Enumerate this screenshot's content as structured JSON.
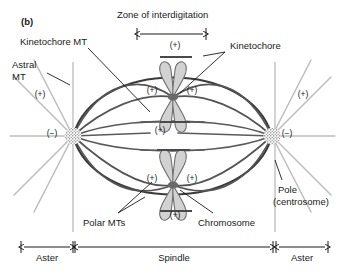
{
  "figure": {
    "panel_label": "(b)"
  },
  "labels": {
    "zone": "Zone of interdigitation",
    "kinetochore_mt": "Kinetochore MT",
    "kinetochore": "Kinetochore",
    "astral_mt_line1": "Astral",
    "astral_mt_line2": "MT",
    "polar_mts": "Polar MTs",
    "chromosome": "Chromosome",
    "pole_line1": "Pole",
    "pole_line2": "(centrosome)"
  },
  "polarity": {
    "plus": "(+)",
    "minus": "(−)"
  },
  "plus_markers": [
    {
      "id": "plus-top-interdigitation",
      "text": "(+)",
      "x": 175,
      "y": 48
    },
    {
      "id": "plus-upper-chromosome-left",
      "text": "(+)",
      "x": 152,
      "y": 93
    },
    {
      "id": "plus-upper-chromosome-right",
      "text": "(+)",
      "x": 192,
      "y": 93
    },
    {
      "id": "plus-astral-left",
      "text": "(+)",
      "x": 40,
      "y": 97
    },
    {
      "id": "plus-astral-right",
      "text": "(+)",
      "x": 303,
      "y": 97
    },
    {
      "id": "plus-polar-mid",
      "text": "(+)",
      "x": 160,
      "y": 133
    },
    {
      "id": "plus-lower-chromosome-left",
      "text": "(+)",
      "x": 152,
      "y": 181
    },
    {
      "id": "plus-lower-chromosome-right",
      "text": "(+)",
      "x": 192,
      "y": 181
    },
    {
      "id": "plus-bottom-interdigitation",
      "text": "(+)",
      "x": 175,
      "y": 218
    }
  ],
  "minus_markers": [
    {
      "id": "minus-left-pole",
      "text": "(−)",
      "x": 52,
      "y": 136
    },
    {
      "id": "minus-right-pole",
      "text": "(−)",
      "x": 287,
      "y": 136
    }
  ],
  "scale_bar": {
    "segments": [
      {
        "id": "aster-left",
        "label": "Aster",
        "x1": 21,
        "x2": 73
      },
      {
        "id": "spindle",
        "label": "Spindle",
        "x1": 75,
        "x2": 273
      },
      {
        "id": "aster-right",
        "label": "Aster",
        "x1": 276,
        "x2": 328
      }
    ],
    "axis_y": 247,
    "label_y": 261
  },
  "colors": {
    "ink": "#1a1a1a",
    "spindle_dark": "#3a3a3a",
    "spindle_mid": "#5a5a5a",
    "astral_gray": "#b8b8b8",
    "guideline": "#c8c8c8",
    "chromosome_fill": "#d2d2d2",
    "chromosome_stroke": "#6e6e6e",
    "centrosome": "#4a4a4a",
    "background": "#ffffff"
  },
  "geometry": {
    "left_pole": {
      "x": 73,
      "y": 136
    },
    "right_pole": {
      "x": 272,
      "y": 136
    },
    "upper_chromosome_center": {
      "x": 173,
      "y": 97
    },
    "lower_chromosome_center": {
      "x": 173,
      "y": 185
    },
    "guideline_left_x": 73,
    "guideline_right_x": 275
  }
}
